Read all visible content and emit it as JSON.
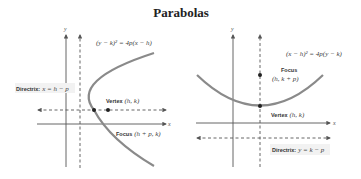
{
  "title": "Parabolas",
  "panels": [
    {
      "orientation": "horizontal",
      "equation": "(y − k)² = 4p(x − h)",
      "y_axis_label": "y",
      "x_axis_label": "x",
      "directrix": {
        "label_bold": "Directrix:",
        "label_eq": "x = h − p"
      },
      "vertex": {
        "label_bold": "Vertex",
        "label_eq": "(h, k)"
      },
      "focus": {
        "label_bold": "Focus",
        "label_eq": "(h + p, k)"
      }
    },
    {
      "orientation": "vertical",
      "equation": "(x − h)² = 4p(y − k)",
      "y_axis_label": "y",
      "x_axis_label": "x",
      "directrix": {
        "label_bold": "Directrix:",
        "label_eq": "y = k − p"
      },
      "vertex": {
        "label_bold": "Vertex",
        "label_eq": "(h, k)"
      },
      "focus": {
        "label_bold": "Focus",
        "label_eq": "(h, k + p)"
      }
    }
  ]
}
